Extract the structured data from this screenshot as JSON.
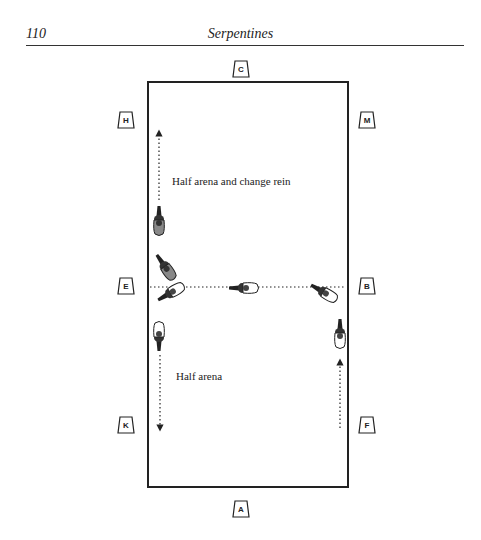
{
  "header": {
    "page_number": "110",
    "title": "Serpentines"
  },
  "diagram": {
    "arena_markers": {
      "top": "C",
      "bottom": "A",
      "left": [
        "H",
        "E",
        "K"
      ],
      "right": [
        "M",
        "B",
        "F"
      ]
    },
    "annotations": {
      "upper": "Half arena and change rein",
      "lower": "Half arena"
    }
  }
}
